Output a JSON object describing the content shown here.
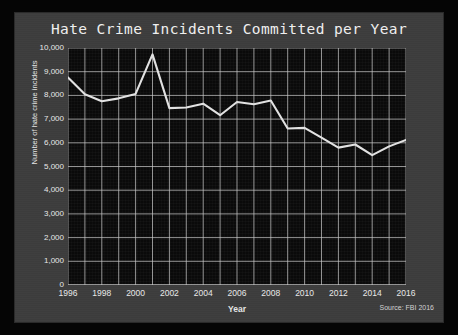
{
  "chart_data": {
    "type": "line",
    "title": "Hate Crime Incidents Committed per Year",
    "xlabel": "Year",
    "ylabel": "Number of hate crime incidents",
    "source": "Source: FBI 2016",
    "grid": true,
    "legend": "none",
    "xlim": [
      1996,
      2016
    ],
    "ylim": [
      0,
      10000
    ],
    "x": [
      1996,
      1997,
      1998,
      1999,
      2000,
      2001,
      2002,
      2003,
      2004,
      2005,
      2006,
      2007,
      2008,
      2009,
      2010,
      2011,
      2012,
      2013,
      2014,
      2015,
      2016
    ],
    "values": [
      8759,
      8049,
      7755,
      7876,
      8063,
      9730,
      7462,
      7489,
      7649,
      7163,
      7722,
      7624,
      7783,
      6604,
      6628,
      6222,
      5796,
      5928,
      5479,
      5850,
      6121
    ],
    "xticks": [
      1996,
      1998,
      2000,
      2002,
      2004,
      2006,
      2008,
      2010,
      2012,
      2014,
      2016
    ],
    "xtick_labels": [
      "1996",
      "1998",
      "2000",
      "2002",
      "2004",
      "2006",
      "2008",
      "2010",
      "2012",
      "2014",
      "2016"
    ],
    "yticks": [
      0,
      1000,
      2000,
      3000,
      4000,
      5000,
      6000,
      7000,
      8000,
      9000,
      10000
    ],
    "ytick_labels": [
      "0",
      "1,000",
      "2,000",
      "3,000",
      "4,000",
      "5,000",
      "6,000",
      "7,000",
      "8,000",
      "9,000",
      "10,000"
    ],
    "series_name": "Hate crime incidents",
    "line_color": "#e2e2e2",
    "plot_background": "#0a0a0a",
    "panel_background": "#3d3d3d",
    "frame_color": "#050505",
    "grid_color": "#c9c9c9",
    "text_color": "#e8e8e8"
  }
}
